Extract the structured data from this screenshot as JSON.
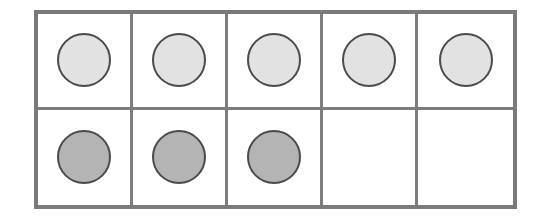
{
  "ten_frame": {
    "rows": 2,
    "columns": 5,
    "frame_color": "#7a7a7a",
    "counter_border_color": "#4a4a4a",
    "cells": [
      {
        "row": 1,
        "col": 1,
        "counter": "light"
      },
      {
        "row": 1,
        "col": 2,
        "counter": "light"
      },
      {
        "row": 1,
        "col": 3,
        "counter": "light"
      },
      {
        "row": 1,
        "col": 4,
        "counter": "light"
      },
      {
        "row": 1,
        "col": 5,
        "counter": "light"
      },
      {
        "row": 2,
        "col": 1,
        "counter": "dark"
      },
      {
        "row": 2,
        "col": 2,
        "counter": "dark"
      },
      {
        "row": 2,
        "col": 3,
        "counter": "dark"
      },
      {
        "row": 2,
        "col": 4,
        "counter": null
      },
      {
        "row": 2,
        "col": 5,
        "counter": null
      }
    ],
    "counter_colors": {
      "light": "#e2e2e2",
      "dark": "#b4b4b4"
    },
    "counts": {
      "light": 5,
      "dark": 3,
      "empty": 2,
      "total_filled": 8
    }
  }
}
